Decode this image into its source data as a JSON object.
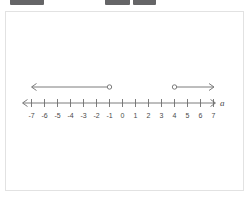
{
  "top_chrome": {
    "blocks": [
      {
        "left": 10,
        "width": 34
      },
      {
        "left": 105,
        "width": 25
      },
      {
        "left": 133,
        "width": 23
      }
    ]
  },
  "figure": {
    "axis_variable_label": "a",
    "axis_label_icon": "italic-variable-a",
    "left_arrow_icon": "left-arrowhead",
    "right_arrow_icon": "right-arrowhead"
  },
  "chart_data": {
    "type": "line",
    "title": "",
    "subtitle": "",
    "xlabel": "a",
    "ylabel": "",
    "grid": false,
    "legend_position": "none",
    "axis_style": "number-line-double-arrow",
    "xlim": [
      -7.6,
      7.6
    ],
    "x": [
      -7,
      -6,
      -5,
      -4,
      -3,
      -2,
      -1,
      0,
      1,
      2,
      3,
      4,
      5,
      6,
      7
    ],
    "tick_labels": [
      "-7",
      "-6",
      "-5",
      "-4",
      "-3",
      "-2",
      "-1",
      "0",
      "1",
      "2",
      "3",
      "4",
      "5",
      "6",
      "7"
    ],
    "annotations": [
      {
        "name": "left-ray",
        "endpoint_value": -1,
        "endpoint_style": "open-circle",
        "direction": "left",
        "arrow_tip_value": -7,
        "inequality": "a < -1"
      },
      {
        "name": "right-ray",
        "endpoint_value": 4,
        "endpoint_style": "open-circle",
        "direction": "right",
        "arrow_tip_value": 7,
        "inequality": "a > 4"
      }
    ],
    "solution_text": "a < -1 or a > 4"
  },
  "colors": {
    "stroke": "#6d6d6d",
    "label": "#4a4a4a",
    "card_background": "#ffffff",
    "card_border": "#e2e2e2",
    "chrome_block": "#58585a"
  }
}
